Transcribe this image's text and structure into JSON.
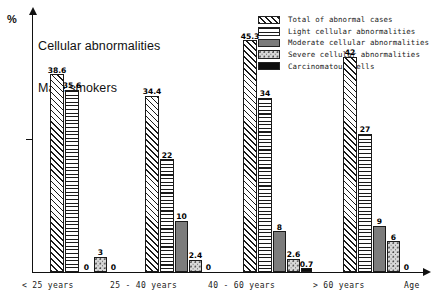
{
  "chart_data": {
    "type": "bar",
    "title": "Cellular abnormalities",
    "subtitle": "Male smokers",
    "xlabel": "Age",
    "ylabel": "%",
    "grid": false,
    "legend_position": "top-right",
    "ylim": [
      0,
      50
    ],
    "categories": [
      "< 25 years",
      "25 - 40 years",
      "40 - 60 years",
      "> 60 years"
    ],
    "series": [
      {
        "name": "Total of abnormal cases",
        "pattern": "diagonal-hatch",
        "values": [
          38.6,
          34.4,
          45.3,
          42
        ],
        "labels": [
          "38.6",
          "34.4",
          "45.3",
          "42"
        ]
      },
      {
        "name": "Light cellular abnormalities",
        "pattern": "horizontal-lines",
        "values": [
          35.6,
          22,
          34,
          27
        ],
        "labels": [
          "35.6",
          "22",
          "34",
          "27"
        ]
      },
      {
        "name": "Moderate cellular abnormalities",
        "pattern": "solid-gray",
        "values": [
          0,
          10,
          8,
          9
        ],
        "labels": [
          "0",
          "10",
          "8",
          "9"
        ]
      },
      {
        "name": "Severe cellular abnormalities",
        "pattern": "stipple",
        "values": [
          3,
          2.4,
          2.6,
          6
        ],
        "labels": [
          "3",
          "2.4",
          "2.6",
          "6"
        ]
      },
      {
        "name": "Carcinomatous cells",
        "pattern": "solid-black",
        "values": [
          0,
          0,
          0.7,
          0
        ],
        "labels": [
          "0",
          "0",
          "0.7",
          "0"
        ]
      }
    ]
  },
  "legend": {
    "items": [
      {
        "label": "Total of abnormal cases"
      },
      {
        "label": "Light cellular abnormalities"
      },
      {
        "label": "Moderate cellular abnormalities"
      },
      {
        "label": "Severe cellular abnormalities"
      },
      {
        "label": "Carcinomatous cells"
      }
    ]
  },
  "axes": {
    "y_unit": "%",
    "x_name": "Age"
  }
}
